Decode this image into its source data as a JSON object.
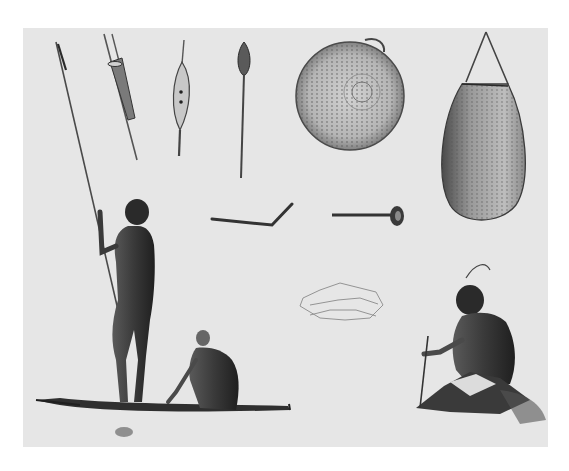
{
  "image": {
    "kind": "lithograph plate",
    "description": "Illustration of Aboriginal Australian people and objects: spears, a spear-thrower, a paddle/club, a round coiled basket, a hanging woven bag, boomerang-like implements, a standing man with spear on a bark canoe, a seated figure in the canoe, and a seated man drilling fire/working with a stick.",
    "colors": {
      "page": "#ffffff",
      "plate": "#e6e6e6",
      "ink_dark": "#2a2a2a",
      "ink_mid": "#6a6a6a",
      "ink_light": "#a8a8a8"
    },
    "objects": [
      {
        "name": "long-spear",
        "position": "left"
      },
      {
        "name": "multi-prong-spear",
        "position": "top-left"
      },
      {
        "name": "leaf-shaped-spear-thrower",
        "position": "top"
      },
      {
        "name": "paddle-club",
        "position": "top-center"
      },
      {
        "name": "coiled-round-basket",
        "position": "top-center-right"
      },
      {
        "name": "hanging-woven-bag",
        "position": "top-right"
      },
      {
        "name": "bent-throwing-stick",
        "position": "center"
      },
      {
        "name": "knobbed-club",
        "position": "center-right"
      },
      {
        "name": "sketched-fish-net",
        "position": "center"
      },
      {
        "name": "standing-man-with-spear",
        "position": "left"
      },
      {
        "name": "seated-man-in-canoe",
        "position": "bottom-center-left"
      },
      {
        "name": "bark-canoe",
        "position": "bottom-left"
      },
      {
        "name": "seated-man-fire-drilling",
        "position": "bottom-right"
      }
    ]
  }
}
